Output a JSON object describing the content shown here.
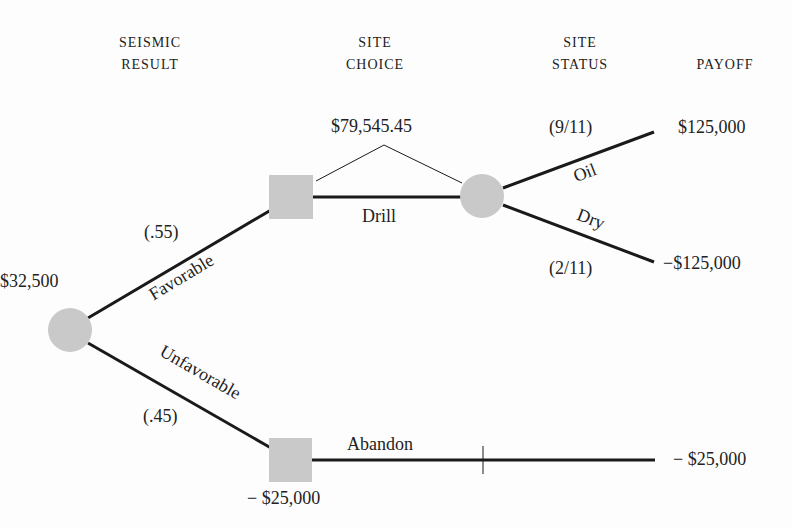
{
  "headers": {
    "seismic_result": [
      "SEISMIC",
      "RESULT"
    ],
    "site_choice": [
      "SITE",
      "CHOICE"
    ],
    "site_status": [
      "SITE",
      "STATUS"
    ],
    "payoff": "PAYOFF"
  },
  "nodes": {
    "root": {
      "type": "chance",
      "value": "$32,500"
    },
    "favorable_decision": {
      "type": "decision",
      "value": "$79,545.45"
    },
    "drill_chance": {
      "type": "chance"
    },
    "unfavorable_decision": {
      "type": "decision",
      "value": "− $25,000"
    }
  },
  "branches": {
    "favorable": {
      "label": "Favorable",
      "prob": "(.55)"
    },
    "unfavorable": {
      "label": "Unfavorable",
      "prob": "(.45)"
    },
    "drill": {
      "label": "Drill"
    },
    "abandon": {
      "label": "Abandon"
    },
    "oil": {
      "label": "Oil",
      "prob": "(9/11)",
      "payoff": "$125,000"
    },
    "dry": {
      "label": "Dry",
      "prob": "(2/11)",
      "payoff": "−$125,000"
    },
    "abandon_payoff": "− $25,000"
  },
  "colors": {
    "node_fill": "#c9c9c9",
    "line": "#1a1a1a"
  }
}
